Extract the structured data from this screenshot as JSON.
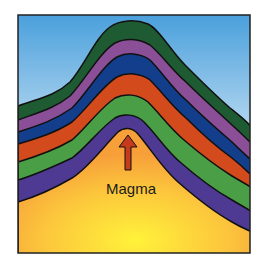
{
  "diagram": {
    "label": "Magma",
    "arrow": "upward-arrow",
    "colors": {
      "sky_top": "#4aa0dc",
      "sky_bottom": "#e6f2fa",
      "magma_center": "#fff23a",
      "magma_edge": "#f7a83a",
      "arrow": "#c63a1e",
      "outline": "#111111"
    },
    "layers": [
      {
        "name": "dark-green",
        "color": "#1f5b32"
      },
      {
        "name": "purple",
        "color": "#8a4f96"
      },
      {
        "name": "blue",
        "color": "#123e8c"
      },
      {
        "name": "orange",
        "color": "#d34a1c"
      },
      {
        "name": "green",
        "color": "#4a9e46"
      },
      {
        "name": "indigo",
        "color": "#4f3a93"
      }
    ]
  }
}
